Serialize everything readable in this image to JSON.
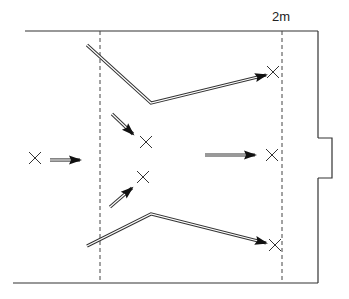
{
  "diagram": {
    "title_label": "2m",
    "colors": {
      "line": "#333333",
      "dashed": "#444444",
      "arrow_fill": "#111111",
      "background": "#ffffff"
    },
    "walls": {
      "top": {
        "x1": 25,
        "y1": 31,
        "x2": 318,
        "y2": 31
      },
      "bottom": {
        "x1": 13,
        "y1": 283,
        "x2": 318,
        "y2": 283
      },
      "right_upper": {
        "x1": 318,
        "y1": 31,
        "x2": 318,
        "y2": 138
      },
      "notch": [
        [
          318,
          138
        ],
        [
          332,
          138
        ],
        [
          332,
          178
        ],
        [
          318,
          178
        ]
      ],
      "right_lower": {
        "x1": 318,
        "y1": 178,
        "x2": 318,
        "y2": 283
      }
    },
    "dashed_lines": [
      {
        "x": 100,
        "y1": 31,
        "y2": 283
      },
      {
        "x": 282,
        "y1": 31,
        "y2": 283
      }
    ],
    "markers": [
      {
        "name": "start",
        "x": 35,
        "y": 158
      },
      {
        "name": "upper-inner",
        "x": 146,
        "y": 142
      },
      {
        "name": "lower-inner",
        "x": 143,
        "y": 177
      },
      {
        "name": "middle-target",
        "x": 272,
        "y": 155
      },
      {
        "name": "upper-target",
        "x": 273,
        "y": 72
      },
      {
        "name": "lower-target",
        "x": 275,
        "y": 245
      }
    ],
    "arrows": [
      {
        "name": "start-arrow",
        "points": [
          [
            50,
            160
          ],
          [
            80,
            160
          ]
        ]
      },
      {
        "name": "upper-path-arrow",
        "points": [
          [
            87,
            45
          ],
          [
            151,
            103
          ],
          [
            266,
            75
          ]
        ]
      },
      {
        "name": "lower-path-arrow",
        "points": [
          [
            87,
            246
          ],
          [
            151,
            214
          ],
          [
            266,
            243
          ]
        ]
      },
      {
        "name": "upper-diagonal-arrow",
        "points": [
          [
            112,
            114
          ],
          [
            133,
            134
          ]
        ]
      },
      {
        "name": "lower-diagonal-arrow",
        "points": [
          [
            110,
            207
          ],
          [
            132,
            188
          ]
        ]
      },
      {
        "name": "middle-arrow",
        "points": [
          [
            205,
            155
          ],
          [
            255,
            155
          ]
        ]
      }
    ]
  }
}
